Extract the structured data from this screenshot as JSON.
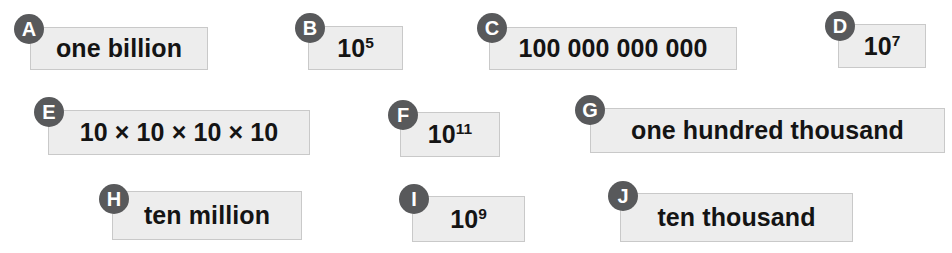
{
  "worksheet": {
    "title": "Number representation matching cards",
    "background_color": "#ffffff",
    "card_fill": "#ededed",
    "card_border": "#c9c9c9",
    "badge_color": "#58595b",
    "badge_text_color": "#ffffff",
    "text_color": "#141414"
  },
  "cards": [
    {
      "badge": "A",
      "label": "one billion",
      "kind": "words",
      "base": "",
      "exponent": "",
      "badge_x": 14,
      "badge_y": 14,
      "x": 30,
      "y": 27,
      "w": 178,
      "h": 43
    },
    {
      "badge": "B",
      "label": "105",
      "kind": "power",
      "base": "10",
      "exponent": "5",
      "badge_x": 295,
      "badge_y": 13,
      "x": 308,
      "y": 26,
      "w": 95,
      "h": 44
    },
    {
      "badge": "C",
      "label": "100 000 000 000",
      "kind": "digits",
      "base": "",
      "exponent": "",
      "badge_x": 477,
      "badge_y": 13,
      "x": 489,
      "y": 27,
      "w": 248,
      "h": 43
    },
    {
      "badge": "D",
      "label": "107",
      "kind": "power",
      "base": "10",
      "exponent": "7",
      "badge_x": 825,
      "badge_y": 11,
      "x": 838,
      "y": 24,
      "w": 88,
      "h": 44
    },
    {
      "badge": "E",
      "label": "10 × 10 × 10 × 10",
      "kind": "product",
      "base": "",
      "exponent": "",
      "badge_x": 34,
      "badge_y": 97,
      "x": 48,
      "y": 110,
      "w": 262,
      "h": 45
    },
    {
      "badge": "F",
      "label": "1011",
      "kind": "power",
      "base": "10",
      "exponent": "11",
      "badge_x": 388,
      "badge_y": 100,
      "x": 400,
      "y": 112,
      "w": 100,
      "h": 45
    },
    {
      "badge": "G",
      "label": "one hundred thousand",
      "kind": "words",
      "base": "",
      "exponent": "",
      "badge_x": 575,
      "badge_y": 95,
      "x": 590,
      "y": 108,
      "w": 355,
      "h": 45
    },
    {
      "badge": "H",
      "label": "ten million",
      "kind": "words",
      "base": "",
      "exponent": "",
      "badge_x": 99,
      "badge_y": 184,
      "x": 112,
      "y": 191,
      "w": 190,
      "h": 49
    },
    {
      "badge": "I",
      "label": "109",
      "kind": "power",
      "base": "10",
      "exponent": "9",
      "badge_x": 399,
      "badge_y": 184,
      "x": 412,
      "y": 196,
      "w": 113,
      "h": 46
    },
    {
      "badge": "J",
      "label": "ten thousand",
      "kind": "words",
      "base": "",
      "exponent": "",
      "badge_x": 608,
      "badge_y": 181,
      "x": 620,
      "y": 193,
      "w": 233,
      "h": 49
    }
  ]
}
